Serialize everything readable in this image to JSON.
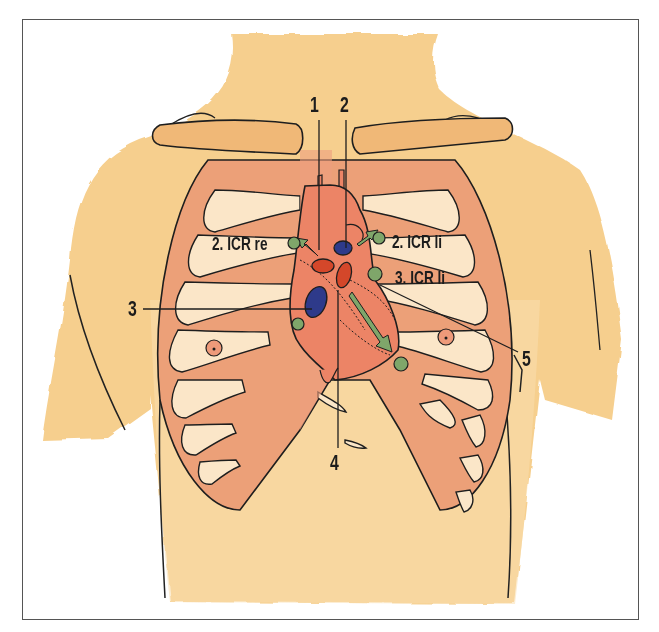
{
  "figure": {
    "type": "anatomical-illustration",
    "colors": {
      "skin": "#f6cf8e",
      "skin_light": "#f9dfaf",
      "ribs": "#ec9e74",
      "rib_gaps": "#fbe7cc",
      "heart": "#ec8466",
      "clavicle": "#f0b877",
      "valve_red": "#d4472a",
      "valve_blue": "#2e3a8a",
      "marker_green": "#7fa66a",
      "outline": "#1e1e1e",
      "frame": "#555555"
    }
  },
  "labels": {
    "n1": "1",
    "n2": "2",
    "n3": "3",
    "n4": "4",
    "n5": "5",
    "icr_2_right": "2. ICR re",
    "icr_2_left": "2. ICR li",
    "icr_3_left": "3. ICR li"
  },
  "auscultation_points": [
    {
      "id": "aortic",
      "label": "2. ICR re"
    },
    {
      "id": "pulmonary",
      "label": "2. ICR li"
    },
    {
      "id": "erb",
      "label": "3. ICR li"
    },
    {
      "id": "tricuspid",
      "label": "3"
    },
    {
      "id": "mitral",
      "label": "5"
    }
  ]
}
